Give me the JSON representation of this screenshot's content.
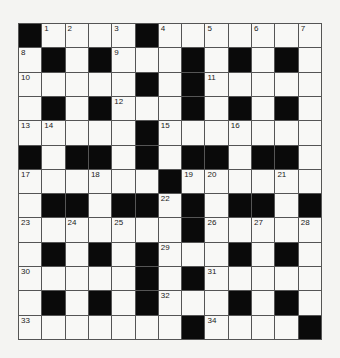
{
  "puzzle": {
    "rows": 13,
    "cols": 13,
    "colors": {
      "black": "#0a0a0a",
      "white": "#f8f8f6",
      "line": "#555555"
    },
    "grid": [
      [
        "#",
        "1",
        "2",
        ".",
        "3",
        "#",
        "4",
        ".",
        "5",
        ".",
        "6",
        ".",
        "7"
      ],
      [
        "8",
        "#",
        ".",
        "#",
        "9",
        ".",
        ".",
        "#",
        ".",
        "#",
        ".",
        "#",
        "."
      ],
      [
        "10",
        ".",
        ".",
        ".",
        ".",
        "#",
        ".",
        "#",
        "11",
        ".",
        ".",
        ".",
        "."
      ],
      [
        ".",
        "#",
        ".",
        "#",
        "12",
        ".",
        ".",
        "#",
        ".",
        "#",
        ".",
        "#",
        "."
      ],
      [
        "13",
        "14",
        ".",
        ".",
        ".",
        "#",
        "15",
        ".",
        ".",
        "16",
        ".",
        ".",
        "."
      ],
      [
        "#",
        ".",
        "#",
        "#",
        ".",
        "#",
        ".",
        "#",
        "#",
        ".",
        "#",
        "#",
        "."
      ],
      [
        "17",
        ".",
        ".",
        "18",
        ".",
        ".",
        "#",
        "19",
        "20",
        ".",
        ".",
        "21",
        "."
      ],
      [
        ".",
        "#",
        "#",
        ".",
        "#",
        "#",
        "22",
        "#",
        ".",
        "#",
        "#",
        ".",
        "#"
      ],
      [
        "23",
        ".",
        "24",
        ".",
        "25",
        ".",
        ".",
        "#",
        "26",
        ".",
        "27",
        ".",
        "28"
      ],
      [
        ".",
        "#",
        ".",
        "#",
        ".",
        "#",
        "29",
        ".",
        ".",
        "#",
        ".",
        "#",
        "."
      ],
      [
        "30",
        ".",
        ".",
        ".",
        ".",
        "#",
        ".",
        "#",
        "31",
        ".",
        ".",
        ".",
        "."
      ],
      [
        ".",
        "#",
        ".",
        "#",
        ".",
        "#",
        "32",
        ".",
        ".",
        "#",
        ".",
        "#",
        "."
      ],
      [
        "33",
        ".",
        ".",
        ".",
        ".",
        ".",
        ".",
        "#",
        "34",
        ".",
        ".",
        ".",
        "#"
      ]
    ]
  }
}
